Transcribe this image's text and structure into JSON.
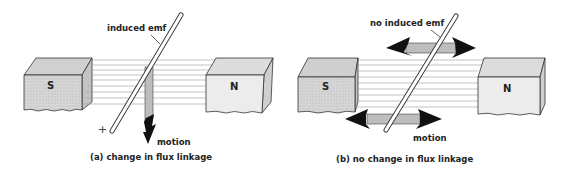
{
  "panels": [
    {
      "id": "a",
      "caption": "(a) change in flux linkage",
      "emf_label": "induced emf",
      "motion_label": "motion",
      "polarity": "+",
      "magnet_left": "S",
      "magnet_right": "N",
      "motion_direction": "down"
    },
    {
      "id": "b",
      "caption": "(b) no change in flux linkage",
      "emf_label": "no induced emf",
      "motion_label": "motion",
      "magnet_left": "S",
      "magnet_right": "N",
      "motion_direction": "left-right"
    }
  ],
  "colors": {
    "ink": "#222222",
    "magnet_face": "#e6e6e6",
    "magnet_s_face": "#d9d9d9",
    "magnet_top": "#cfcfcf",
    "magnet_side": "#bdbdbd",
    "flux_line": "#9a9a9a",
    "motion_band": "#bdbdbd",
    "arrow": "#111111"
  }
}
